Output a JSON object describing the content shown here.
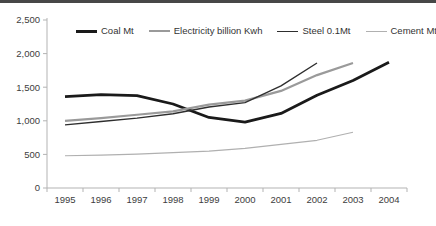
{
  "page": {
    "top_bar_color": "#474747",
    "background_color": "#ffffff"
  },
  "chart_data": {
    "type": "line",
    "title": "",
    "xlabel": "",
    "ylabel": "",
    "grid": false,
    "legend_position": "top",
    "ylim": [
      0,
      2500
    ],
    "y_ticks": [
      {
        "value": 0,
        "label": "0"
      },
      {
        "value": 500,
        "label": "500"
      },
      {
        "value": 1000,
        "label": "1,000"
      },
      {
        "value": 1500,
        "label": "1,500"
      },
      {
        "value": 2000,
        "label": "2,000"
      },
      {
        "value": 2500,
        "label": "2,500"
      }
    ],
    "x": [
      1995,
      1996,
      1997,
      1998,
      1999,
      2000,
      2001,
      2002,
      2003,
      2004
    ],
    "x_tick_labels": [
      "1995",
      "1996",
      "1997",
      "1998",
      "1999",
      "2000",
      "2001",
      "2002",
      "2003",
      "2004"
    ],
    "series": [
      {
        "name": "Coal Mt",
        "color": "#1a1a1a",
        "stroke_width": 2.8,
        "values": [
          1360,
          1390,
          1375,
          1250,
          1050,
          980,
          1110,
          1380,
          1600,
          1870
        ]
      },
      {
        "name": "Electricity billion Kwh",
        "color": "#9a9a9a",
        "stroke_width": 2.2,
        "values": [
          1000,
          1040,
          1090,
          1140,
          1240,
          1300,
          1445,
          1680,
          1860,
          null
        ]
      },
      {
        "name": "Steel 0.1Mt",
        "color": "#2e2e2e",
        "stroke_width": 1.4,
        "values": [
          940,
          990,
          1040,
          1105,
          1205,
          1270,
          1520,
          1860,
          null,
          null
        ]
      },
      {
        "name": "Cement Mt",
        "color": "#b0b0b0",
        "stroke_width": 1.2,
        "values": [
          480,
          490,
          505,
          525,
          550,
          590,
          650,
          710,
          830,
          null
        ]
      }
    ]
  }
}
